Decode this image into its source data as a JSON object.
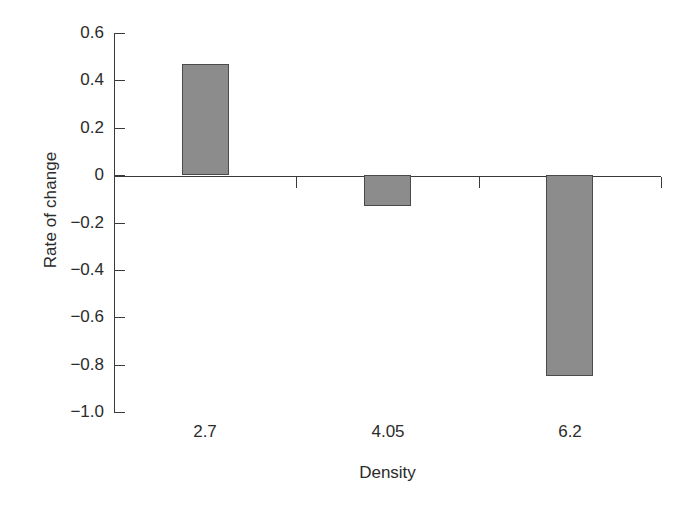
{
  "chart_data": {
    "type": "bar",
    "title": "",
    "subtitle": "",
    "xlabel": "Density",
    "ylabel": "Rate of change",
    "categories": [
      "2.7",
      "4.05",
      "6.2"
    ],
    "values": [
      0.47,
      -0.13,
      -0.85
    ],
    "series": [
      {
        "name": "Rate of change",
        "values": [
          0.47,
          -0.13,
          -0.85
        ]
      }
    ],
    "ylim": [
      -1.0,
      0.6
    ],
    "ytick_labels": [
      "0.6",
      "0.4",
      "0.2",
      "0",
      "−0.2",
      "−0.4",
      "−0.6",
      "−0.8",
      "−1.0"
    ],
    "ytick_values": [
      0.6,
      0.4,
      0.2,
      0,
      -0.2,
      -0.4,
      -0.6,
      -0.8,
      -1.0
    ],
    "xtick_labels": [
      "2.7",
      "4.05",
      "6.2"
    ],
    "grid": false,
    "legend": null,
    "legend_position": "none",
    "annotations": [],
    "colors": {
      "bar_fill": "#8c8c8c",
      "bar_edge": "#4a4a4a",
      "axis": "#3a3a3a",
      "text": "#2b2b2b",
      "background": "#ffffff"
    }
  }
}
